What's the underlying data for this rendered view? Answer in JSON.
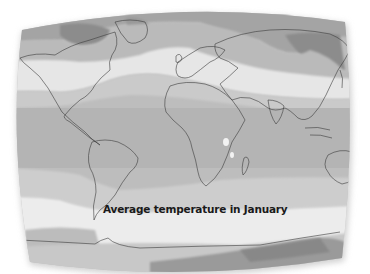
{
  "map": {
    "caption": "Average temperature in January",
    "projection": "world map, curved screen-like frame",
    "style": "grayscale temperature bands",
    "legend": null
  },
  "colors": {
    "background": "#ffffff",
    "frame_shadow": "#c8c8c8",
    "band_very_cold": "#8a8a8a",
    "band_cold": "#a8a8a8",
    "band_cool": "#c6c6c6",
    "band_mild": "#e6e6e6",
    "band_warm": "#bdbdbd",
    "band_hot": "#b2b2b2",
    "coastline": "#3a3a3a",
    "caption_text": "#1a1a1a"
  }
}
